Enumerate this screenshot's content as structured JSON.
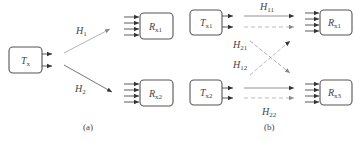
{
  "diagram": {
    "panels": [
      {
        "caption": "(a)",
        "transmitter": {
          "label": "T",
          "sub": "x"
        },
        "receivers": [
          {
            "label": "R",
            "sub": "x1"
          },
          {
            "label": "R",
            "sub": "x2"
          }
        ],
        "channels": [
          {
            "label": "H",
            "sub": "1",
            "from": "T_x",
            "to": "R_x1",
            "style": "solid-light"
          },
          {
            "label": "H",
            "sub": "2",
            "from": "T_x",
            "to": "R_x2",
            "style": "solid-dark"
          }
        ]
      },
      {
        "caption": "(b)",
        "transmitters": [
          {
            "label": "T",
            "sub": "x1"
          },
          {
            "label": "T",
            "sub": "x2"
          }
        ],
        "receivers": [
          {
            "label": "R",
            "sub": "x1"
          },
          {
            "label": "R",
            "sub": "x3"
          }
        ],
        "channels": [
          {
            "label": "H",
            "sub": "11",
            "from": "T_x1",
            "to": "R_x1",
            "style": "solid"
          },
          {
            "label": "H",
            "sub": "21",
            "from": "T_x1",
            "to": "R_x3",
            "style": "dashed"
          },
          {
            "label": "H",
            "sub": "12",
            "from": "T_x2",
            "to": "R_x1",
            "style": "dashed"
          },
          {
            "label": "H",
            "sub": "22",
            "from": "T_x2",
            "to": "R_x3",
            "style": "solid"
          }
        ]
      }
    ],
    "colors": {
      "stroke": "#555555",
      "text": "#444444",
      "dark_line": "#666666",
      "light_line": "#aaaaaa"
    }
  }
}
